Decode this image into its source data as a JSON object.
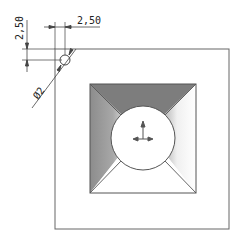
{
  "drawing": {
    "dimensions": {
      "vertical_offset": "2,50",
      "horizontal_offset": "2,50",
      "hole_diameter": "Ø2"
    },
    "colors": {
      "line": "#555555",
      "dark_face": "#7a7a7a",
      "mid_face": "#a0a0a0",
      "background": "#ffffff"
    },
    "icons": {
      "triad": "coordinate-triad-icon"
    }
  }
}
